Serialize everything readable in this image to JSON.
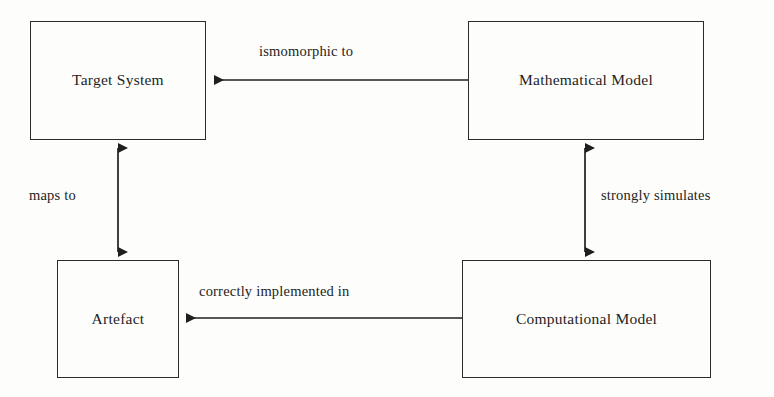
{
  "diagram": {
    "background_color": "#fdfdfc",
    "ink_color": "#2b2b2b",
    "nodes": [
      {
        "id": "target-system",
        "label": "Target System"
      },
      {
        "id": "mathematical-model",
        "label": "Mathematical Model"
      },
      {
        "id": "artefact",
        "label": "Artefact"
      },
      {
        "id": "computational-model",
        "label": "Computational Model"
      }
    ],
    "edges": [
      {
        "id": "isomorphic-to",
        "label": "ismomorphic to",
        "from": "mathematical-model",
        "to": "target-system",
        "orientation": "horizontal",
        "arrowheads": "single-left"
      },
      {
        "id": "maps-to",
        "label": "maps to",
        "from": "artefact",
        "to": "target-system",
        "orientation": "vertical",
        "arrowheads": "double"
      },
      {
        "id": "strongly-simulates",
        "label": "strongly simulates",
        "from": "computational-model",
        "to": "mathematical-model",
        "orientation": "vertical",
        "arrowheads": "double"
      },
      {
        "id": "correctly-implemented-in",
        "label": "correctly implemented in",
        "from": "computational-model",
        "to": "artefact",
        "orientation": "horizontal",
        "arrowheads": "single-left"
      }
    ]
  }
}
